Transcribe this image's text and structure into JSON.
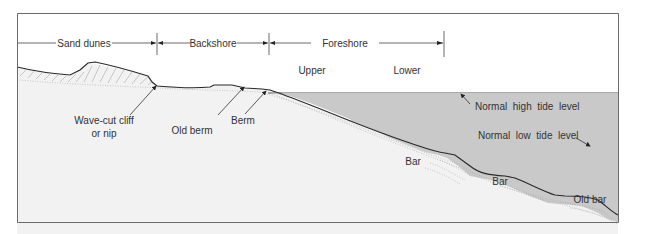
{
  "colors": {
    "frame": "#6b6b6b",
    "water": "#c9c9c9",
    "sand": "#f2f2f2",
    "line": "#3a3a3a",
    "text": "#333333"
  },
  "zones": {
    "sand_dunes": "Sand dunes",
    "backshore": "Backshore",
    "foreshore": "Foreshore",
    "upper": "Upper",
    "lower": "Lower"
  },
  "labels": {
    "wave_cut_cliff_line1": "Wave-cut cliff",
    "wave_cut_cliff_line2": "or nip",
    "old_berm": "Old berm",
    "berm": "Berm",
    "normal_high_tide": "Normal  high  tide  level",
    "normal_low_tide": "Normal  low  tide  level",
    "bar1": "Bar",
    "bar2": "Bar",
    "old_bar": "Old bar"
  }
}
